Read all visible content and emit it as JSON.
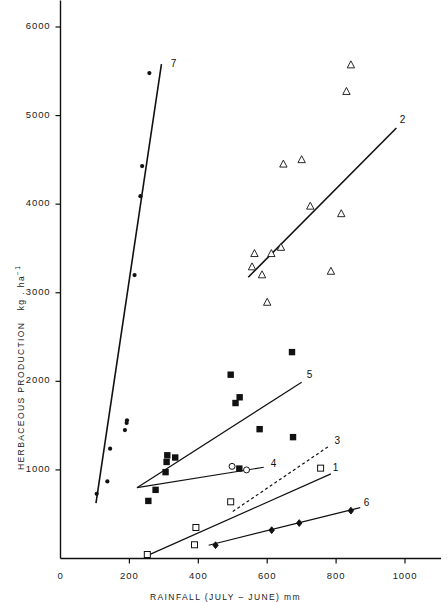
{
  "chart_data": {
    "type": "scatter",
    "title": "",
    "xlabel": "RAINFALL (JULY – JUNE) mm",
    "ylabel_main": "HERBACEOUS   PRODUCTION",
    "ylabel_units": "kg . ha",
    "ylabel_units_exp": "−1",
    "xlim": [
      0,
      1100
    ],
    "ylim": [
      0,
      6300
    ],
    "xticks": [
      0,
      200,
      400,
      600,
      800,
      1000
    ],
    "xtick_labels": [
      "0",
      "200",
      "400",
      "600",
      "800",
      "1000"
    ],
    "yticks": [
      1000,
      2000,
      3000,
      4000,
      5000,
      6000
    ],
    "ytick_labels": [
      "1000",
      "2000",
      "3000",
      "4000",
      "5000",
      "6000"
    ],
    "grid": false,
    "legend_position": "inline-line-end-labels",
    "series": [
      {
        "name": "1",
        "label": "1",
        "marker": "open-square",
        "line_style": "solid",
        "line_label_xy": [
          790,
          1010
        ],
        "line_endpoints": [
          [
            250,
            30
          ],
          [
            785,
            955
          ]
        ],
        "points": [
          {
            "x": 252,
            "y": 45
          },
          {
            "x": 389,
            "y": 155
          },
          {
            "x": 393,
            "y": 350
          },
          {
            "x": 494,
            "y": 640
          },
          {
            "x": 755,
            "y": 1020
          }
        ]
      },
      {
        "name": "2",
        "label": "2",
        "marker": "open-triangle",
        "line_style": "solid",
        "line_label_xy": [
          985,
          4935
        ],
        "line_endpoints": [
          [
            545,
            3175
          ],
          [
            975,
            4860
          ]
        ],
        "points": [
          {
            "x": 563,
            "y": 3440
          },
          {
            "x": 556,
            "y": 3290
          },
          {
            "x": 585,
            "y": 3200
          },
          {
            "x": 612,
            "y": 3440
          },
          {
            "x": 600,
            "y": 2890
          },
          {
            "x": 647,
            "y": 4450
          },
          {
            "x": 700,
            "y": 4500
          },
          {
            "x": 725,
            "y": 3975
          },
          {
            "x": 785,
            "y": 3240
          },
          {
            "x": 815,
            "y": 3890
          },
          {
            "x": 843,
            "y": 5570
          },
          {
            "x": 830,
            "y": 5270
          },
          {
            "x": 640,
            "y": 3510
          }
        ]
      },
      {
        "name": "3",
        "label": "3",
        "marker": "none",
        "line_style": "dashed",
        "line_label_xy": [
          795,
          1310
        ],
        "line_endpoints": [
          [
            500,
            530
          ],
          [
            780,
            1270
          ]
        ],
        "points": []
      },
      {
        "name": "4",
        "label": "4",
        "marker": "open-circle",
        "line_style": "solid",
        "line_label_xy": [
          610,
          1060
        ],
        "line_endpoints": [
          [
            222,
            800
          ],
          [
            590,
            1030
          ]
        ],
        "points": [
          {
            "x": 498,
            "y": 1040
          },
          {
            "x": 540,
            "y": 1000
          }
        ]
      },
      {
        "name": "5",
        "label": "5",
        "marker": "filled-square",
        "line_style": "solid",
        "line_label_xy": [
          715,
          2060
        ],
        "line_endpoints": [
          [
            222,
            800
          ],
          [
            700,
            1990
          ]
        ],
        "points": [
          {
            "x": 255,
            "y": 650
          },
          {
            "x": 276,
            "y": 775
          },
          {
            "x": 305,
            "y": 975
          },
          {
            "x": 308,
            "y": 1090
          },
          {
            "x": 310,
            "y": 1165
          },
          {
            "x": 333,
            "y": 1140
          },
          {
            "x": 494,
            "y": 2075
          },
          {
            "x": 508,
            "y": 1755
          },
          {
            "x": 520,
            "y": 1820
          },
          {
            "x": 519,
            "y": 1015
          },
          {
            "x": 578,
            "y": 1460
          },
          {
            "x": 672,
            "y": 2330
          },
          {
            "x": 675,
            "y": 1370
          }
        ]
      },
      {
        "name": "6",
        "label": "6",
        "marker": "filled-diamond",
        "line_style": "solid",
        "line_label_xy": [
          880,
          620
        ],
        "line_endpoints": [
          [
            430,
            150
          ],
          [
            870,
            575
          ]
        ],
        "points": [
          {
            "x": 450,
            "y": 150
          },
          {
            "x": 613,
            "y": 320
          },
          {
            "x": 693,
            "y": 400
          },
          {
            "x": 843,
            "y": 540
          }
        ]
      },
      {
        "name": "7",
        "label": "7",
        "marker": "filled-circle",
        "line_style": "solid",
        "line_label_xy": [
          320,
          5575
        ],
        "line_endpoints": [
          [
            103,
            625
          ],
          [
            293,
            5580
          ]
        ],
        "points": [
          {
            "x": 105,
            "y": 730
          },
          {
            "x": 136,
            "y": 870
          },
          {
            "x": 187,
            "y": 1450
          },
          {
            "x": 192,
            "y": 1530
          },
          {
            "x": 193,
            "y": 1560
          },
          {
            "x": 144,
            "y": 1240
          },
          {
            "x": 215,
            "y": 3200
          },
          {
            "x": 232,
            "y": 4090
          },
          {
            "x": 237,
            "y": 4430
          },
          {
            "x": 258,
            "y": 5480
          }
        ]
      }
    ]
  },
  "axes": {
    "x_axis_name": "x-axis",
    "y_axis_name": "y-axis"
  }
}
